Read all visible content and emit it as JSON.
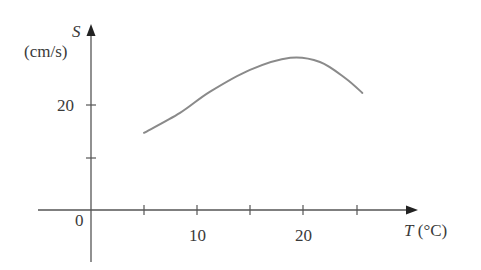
{
  "chart_data": {
    "type": "line",
    "title": "",
    "xlabel": "T (°C)",
    "ylabel": "S (cm/s)",
    "xlabel_var": "T",
    "xlabel_unit": "(°C)",
    "ylabel_var": "S",
    "ylabel_unit": "(cm/s)",
    "x_ticks": [
      5,
      10,
      15,
      20,
      25
    ],
    "x_tick_labels": [
      "10",
      "20"
    ],
    "y_ticks": [
      10,
      20
    ],
    "y_tick_labels": [
      "20"
    ],
    "origin_label": "0",
    "xlim": [
      -5,
      30
    ],
    "ylim": [
      -10,
      33
    ],
    "grid": false,
    "legend": null,
    "series": [
      {
        "name": "S(T)",
        "color": "#8a8a8a",
        "x": [
          5,
          8.4,
          11.2,
          15,
          18.8,
          21.6,
          24,
          25.6
        ],
        "y": [
          14.7,
          18.5,
          22.5,
          26.7,
          29,
          28.2,
          25.1,
          22.3
        ]
      }
    ]
  },
  "labels": {
    "y_var": "S",
    "y_unit": "(cm/s)",
    "y_tick_20": "20",
    "origin": "0",
    "x_tick_10": "10",
    "x_tick_20": "20",
    "x_var": "T",
    "x_unit": "(°C)"
  }
}
